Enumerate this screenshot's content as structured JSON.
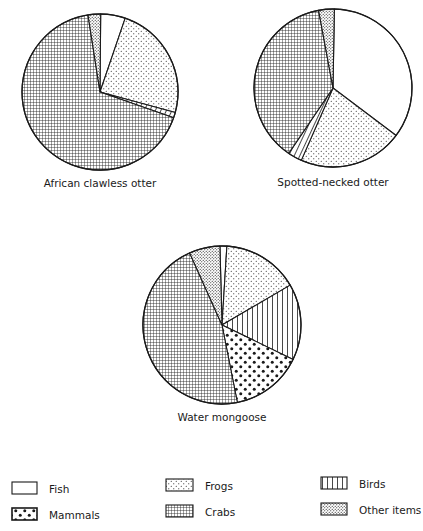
{
  "chart_data": [
    {
      "type": "pie",
      "title": "African clawless otter",
      "categories": [
        "Fish",
        "Frogs",
        "Birds",
        "Crabs",
        "Other items"
      ],
      "values": [
        5.1,
        24.0,
        1.1,
        67.2,
        2.6
      ],
      "start_angle_deg": 0.5
    },
    {
      "type": "pie",
      "title": "Spotted-necked otter",
      "categories": [
        "Fish",
        "Frogs",
        "Birds",
        "Crabs",
        "Other items"
      ],
      "values": [
        35.0,
        21.3,
        2.9,
        37.6,
        3.2
      ],
      "start_angle_deg": 1.0
    },
    {
      "type": "pie",
      "title": "Water mongoose",
      "categories": [
        "Fish",
        "Frogs",
        "Birds",
        "Mammals",
        "Crabs",
        "Other items"
      ],
      "values": [
        1.4,
        15.6,
        15.6,
        14.7,
        46.4,
        6.3
      ],
      "start_angle_deg": -1.5
    }
  ],
  "pies": [
    {
      "title": "African clawless otter",
      "cx": 100,
      "cy": 92,
      "r": 78,
      "label_x": 100,
      "label_y": 187
    },
    {
      "title": "Spotted-necked otter",
      "cx": 333,
      "cy": 88,
      "r": 79,
      "label_x": 333,
      "label_y": 186
    },
    {
      "title": "Water mongoose",
      "cx": 222,
      "cy": 325,
      "r": 79,
      "label_x": 222,
      "label_y": 421
    }
  ],
  "legend": {
    "items": [
      {
        "label": "Fish",
        "pattern": "fish",
        "x": 12,
        "y": 482,
        "w": 25,
        "h": 12
      },
      {
        "label": "Mammals",
        "pattern": "mammals",
        "x": 12,
        "y": 508,
        "w": 25,
        "h": 12
      },
      {
        "label": "Frogs",
        "pattern": "frogs",
        "x": 166,
        "y": 479,
        "w": 27,
        "h": 12
      },
      {
        "label": "Crabs",
        "pattern": "crabs",
        "x": 166,
        "y": 505,
        "w": 27,
        "h": 12
      },
      {
        "label": "Birds",
        "pattern": "birds",
        "x": 321,
        "y": 477,
        "w": 26,
        "h": 12
      },
      {
        "label": "Other items",
        "pattern": "other",
        "x": 321,
        "y": 503,
        "w": 26,
        "h": 12
      }
    ]
  },
  "category_patterns": {
    "Fish": "fish",
    "Frogs": "frogs",
    "Birds": "birds",
    "Mammals": "mammals",
    "Crabs": "crabs",
    "Other items": "other"
  },
  "colors": {
    "ink": "#1a1a1a",
    "background": "#ffffff"
  }
}
